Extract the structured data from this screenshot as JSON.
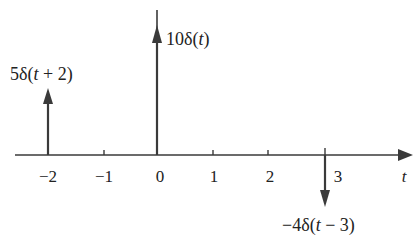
{
  "diagram": {
    "type": "impulse-train",
    "axis": {
      "variable": "t",
      "ticks": [
        {
          "value": -2,
          "label": "−2"
        },
        {
          "value": -1,
          "label": "−1"
        },
        {
          "value": 0,
          "label": "0"
        },
        {
          "value": 1,
          "label": "1"
        },
        {
          "value": 2,
          "label": "2"
        },
        {
          "value": 3,
          "label": "3"
        }
      ]
    },
    "impulses": [
      {
        "position": -2,
        "weight": 5,
        "label_coef": "5δ(",
        "label_var": "t",
        "label_rest": " + 2)"
      },
      {
        "position": 0,
        "weight": 10,
        "label_coef": "10δ(",
        "label_var": "t",
        "label_rest": ")"
      },
      {
        "position": 3,
        "weight": -4,
        "label_coef": "−4δ(",
        "label_var": "t",
        "label_rest": " − 3)"
      }
    ],
    "color": "#3a3a3a"
  }
}
